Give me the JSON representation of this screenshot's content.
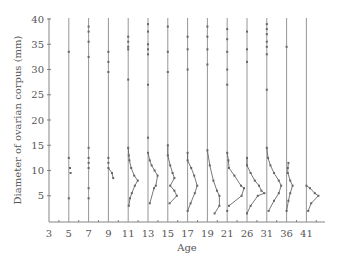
{
  "chart_data": {
    "type": "scatter",
    "title": "",
    "xlabel": "Age",
    "ylabel": "Diameter of ovarian corpus (mm)",
    "x_tick_labels": [
      "3",
      "5",
      "7",
      "9",
      "11",
      "13",
      "15",
      "17",
      "19",
      "21",
      "26",
      "31",
      "36",
      "41"
    ],
    "y_ticks": [
      5,
      10,
      15,
      20,
      25,
      30,
      35,
      40
    ],
    "ylim": [
      0,
      40
    ],
    "grid": false,
    "legend": null,
    "note": "Each vertical line marks an age; points (connected by lines for cyclic development) show individual ovarian corpus diameters offset horizontally from the age line.",
    "series": [
      {
        "age": "5",
        "points": [
          [
            0,
            33.5
          ],
          [
            0,
            12.5
          ],
          [
            0.2,
            10.5
          ],
          [
            0.3,
            9.5
          ],
          [
            0,
            4.5
          ]
        ],
        "connected": []
      },
      {
        "age": "7",
        "points": [
          [
            0,
            38.5
          ],
          [
            0,
            37.5
          ],
          [
            0,
            35.5
          ],
          [
            0,
            32.5
          ],
          [
            0,
            14.5
          ],
          [
            0,
            12.5
          ],
          [
            0,
            11.5
          ],
          [
            0,
            10.5
          ],
          [
            0,
            6.5
          ],
          [
            0,
            4.5
          ]
        ],
        "connected": []
      },
      {
        "age": "9",
        "points": [
          [
            0,
            33.5
          ],
          [
            0,
            31.5
          ],
          [
            0,
            29.5
          ],
          [
            0,
            12.5
          ],
          [
            0,
            11.5
          ],
          [
            0,
            10.5
          ],
          [
            0.6,
            9.5
          ],
          [
            0.8,
            8.5
          ]
        ],
        "connected": [
          [
            5,
            6,
            7
          ]
        ]
      },
      {
        "age": "11",
        "points": [
          [
            0,
            36.5
          ],
          [
            0,
            35.5
          ],
          [
            0,
            34.5
          ],
          [
            0,
            34
          ],
          [
            0,
            28
          ],
          [
            0,
            14.5
          ],
          [
            0.1,
            13
          ],
          [
            0.2,
            12
          ],
          [
            0.5,
            10.5
          ],
          [
            1.0,
            9
          ],
          [
            1.6,
            8
          ],
          [
            1.1,
            7
          ],
          [
            0.6,
            5.5
          ],
          [
            0.3,
            4.5
          ],
          [
            0.1,
            3
          ]
        ],
        "connected": [
          [
            5,
            6,
            7,
            8,
            9,
            10,
            11,
            12,
            13,
            14
          ]
        ]
      },
      {
        "age": "13",
        "points": [
          [
            0,
            39
          ],
          [
            0,
            37.5
          ],
          [
            0,
            35
          ],
          [
            0,
            34
          ],
          [
            0,
            33
          ],
          [
            0,
            27
          ],
          [
            0,
            16.5
          ],
          [
            0,
            13.5
          ],
          [
            0.3,
            12
          ],
          [
            0.6,
            11
          ],
          [
            1.1,
            10
          ],
          [
            1.6,
            9
          ],
          [
            1.3,
            7
          ],
          [
            1.0,
            6.5
          ],
          [
            0.3,
            3.5
          ]
        ],
        "connected": [
          [
            7,
            8,
            9,
            10,
            11,
            12,
            13,
            14
          ]
        ]
      },
      {
        "age": "15",
        "points": [
          [
            0,
            38.5
          ],
          [
            0,
            33.5
          ],
          [
            0,
            29.5
          ],
          [
            0,
            15
          ],
          [
            0,
            13
          ],
          [
            0.4,
            11
          ],
          [
            0.8,
            9.5
          ],
          [
            1.1,
            8.5
          ],
          [
            0.4,
            7
          ],
          [
            1.1,
            6
          ],
          [
            1.5,
            5
          ],
          [
            0.3,
            3.5
          ]
        ],
        "connected": [
          [
            3,
            4,
            5,
            6,
            7,
            8,
            9,
            10,
            11
          ]
        ]
      },
      {
        "age": "17",
        "points": [
          [
            0,
            36.5
          ],
          [
            0,
            34
          ],
          [
            0,
            30
          ],
          [
            0,
            13.5
          ],
          [
            0,
            12
          ],
          [
            0.6,
            10.5
          ],
          [
            1.1,
            9
          ],
          [
            1.6,
            7
          ],
          [
            1.2,
            5.5
          ],
          [
            0.5,
            3.5
          ],
          [
            0,
            2
          ]
        ],
        "connected": [
          [
            3,
            4,
            5,
            6,
            7,
            8,
            9,
            10
          ]
        ]
      },
      {
        "age": "19",
        "points": [
          [
            0,
            38.5
          ],
          [
            0,
            36.5
          ],
          [
            0,
            34
          ],
          [
            0,
            31
          ],
          [
            0,
            14
          ],
          [
            0.4,
            11
          ],
          [
            1.0,
            8
          ],
          [
            1.6,
            6
          ],
          [
            2.0,
            5
          ],
          [
            2.0,
            3
          ],
          [
            1.2,
            1.5
          ]
        ],
        "connected": [
          [
            4,
            5,
            6,
            7,
            8,
            9,
            10
          ]
        ]
      },
      {
        "age": "21",
        "points": [
          [
            0,
            38
          ],
          [
            0,
            36
          ],
          [
            0,
            33.5
          ],
          [
            0,
            30
          ],
          [
            0,
            27
          ],
          [
            0,
            13.5
          ],
          [
            0.2,
            12
          ],
          [
            0.3,
            10.5
          ],
          [
            1.2,
            9
          ],
          [
            2.3,
            7
          ],
          [
            2.8,
            6.5
          ],
          [
            2.4,
            5
          ],
          [
            0.3,
            3
          ],
          [
            0,
            2
          ]
        ],
        "connected": [
          [
            5,
            6,
            7,
            8,
            9,
            10,
            11,
            12
          ]
        ]
      },
      {
        "age": "26",
        "points": [
          [
            0,
            37.5
          ],
          [
            0,
            34
          ],
          [
            0,
            31.5
          ],
          [
            0,
            12.5
          ],
          [
            0,
            11
          ],
          [
            0.6,
            9.5
          ],
          [
            1.3,
            8
          ],
          [
            2.0,
            7
          ],
          [
            2.4,
            6
          ],
          [
            2.9,
            5.5
          ],
          [
            1.8,
            5
          ],
          [
            0.6,
            3
          ],
          [
            0,
            1.5
          ]
        ],
        "connected": [
          [
            3,
            4,
            5,
            6,
            7,
            8,
            9,
            10,
            11,
            12
          ]
        ]
      },
      {
        "age": "31",
        "points": [
          [
            0,
            39
          ],
          [
            0,
            38
          ],
          [
            0,
            37
          ],
          [
            0,
            35.5
          ],
          [
            0,
            34.5
          ],
          [
            0,
            33
          ],
          [
            0,
            26
          ],
          [
            0,
            14.5
          ],
          [
            0.2,
            12.5
          ],
          [
            0.6,
            11
          ],
          [
            1.2,
            9.5
          ],
          [
            2.0,
            8
          ],
          [
            2.4,
            7
          ],
          [
            2.0,
            5.5
          ],
          [
            1.2,
            4
          ],
          [
            0.3,
            2
          ]
        ],
        "connected": [
          [
            7,
            8,
            9,
            10,
            11,
            12,
            13,
            14,
            15
          ]
        ]
      },
      {
        "age": "36",
        "points": [
          [
            0,
            34.5
          ],
          [
            0.3,
            11.5
          ],
          [
            0.2,
            10.5
          ],
          [
            0.2,
            9.5
          ],
          [
            0.6,
            8
          ],
          [
            1.0,
            7
          ],
          [
            0.6,
            5.5
          ],
          [
            0.3,
            4
          ],
          [
            0,
            2
          ]
        ],
        "connected": [
          [
            1,
            2,
            3,
            4,
            5,
            6,
            7,
            8
          ]
        ]
      },
      {
        "age": "41",
        "points": [
          [
            0,
            7
          ],
          [
            0.6,
            6.5
          ],
          [
            1.4,
            5.5
          ],
          [
            2.0,
            5
          ],
          [
            0.8,
            3.5
          ],
          [
            0.3,
            2
          ]
        ],
        "connected": [
          [
            0,
            1,
            2,
            3,
            4,
            5
          ]
        ]
      }
    ]
  }
}
